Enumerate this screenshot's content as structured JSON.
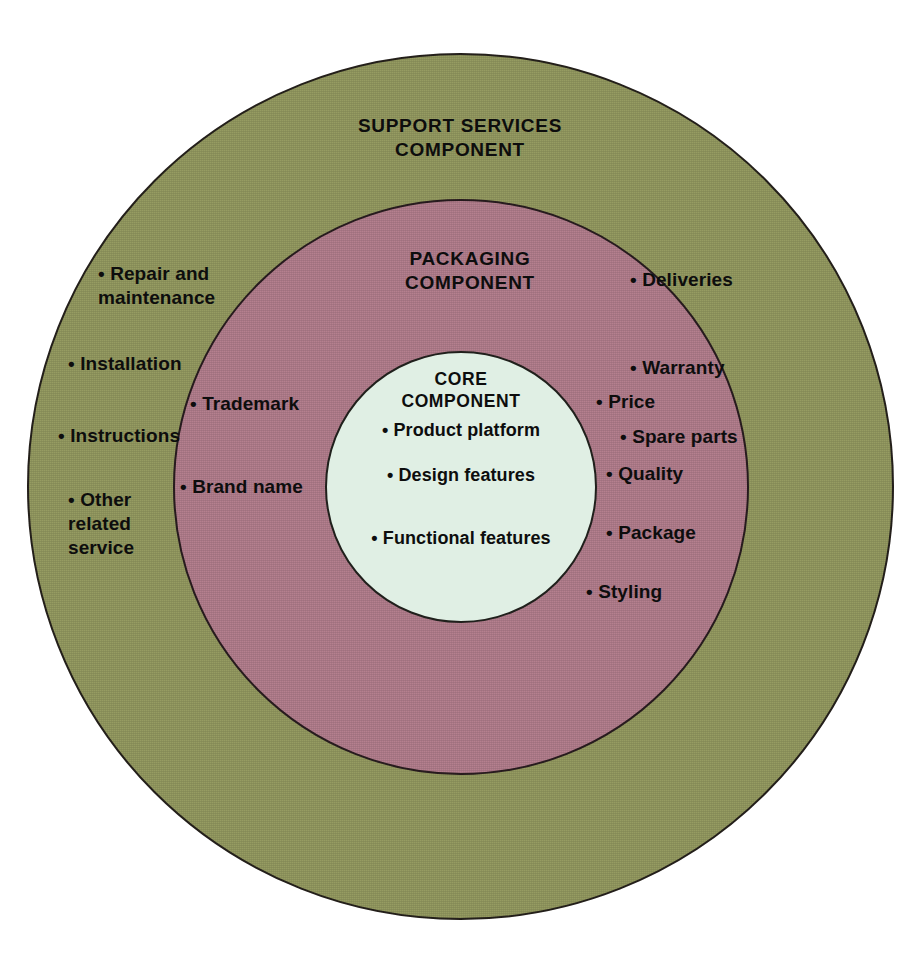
{
  "diagram": {
    "type": "concentric-circles",
    "colors": {
      "outer_ring": "#969c62",
      "middle_ring": "#b5808f",
      "core": "#e0efe4",
      "outline": "#26211c",
      "text": "#0d0d0d",
      "background": "#ffffff"
    },
    "bullet": "•"
  },
  "outer": {
    "heading": "SUPPORT SERVICES\nCOMPONENT",
    "left_items": [
      "• Repair and\n   maintenance",
      "• Installation",
      "• Instructions",
      "• Other\n   related\n   service"
    ],
    "right_items": [
      "• Deliveries",
      "• Warranty",
      "• Spare parts"
    ]
  },
  "middle": {
    "heading": "PACKAGING\nCOMPONENT",
    "left_items": [
      "• Trademark",
      "• Brand name"
    ],
    "right_items": [
      "• Price",
      "• Quality",
      "• Package",
      "• Styling"
    ]
  },
  "core": {
    "heading": "CORE\nCOMPONENT",
    "items": [
      "• Product platform",
      "• Design features",
      "• Functional features"
    ]
  }
}
